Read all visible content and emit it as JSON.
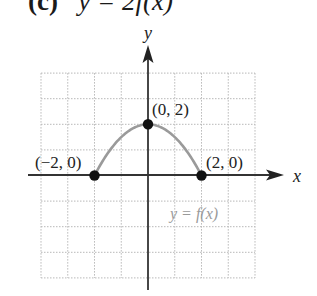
{
  "title": {
    "label": "(c)",
    "equation": "y = 2f(x)"
  },
  "chart_data": {
    "type": "line",
    "title": "(c) y = 2f(x)",
    "xlabel": "x",
    "ylabel": "y",
    "xlim": [
      -4,
      4
    ],
    "ylim": [
      -4,
      4
    ],
    "grid": true,
    "series": [
      {
        "name": "y = f(x)",
        "color": "#9a9a9a",
        "x": [
          -2,
          -1.5,
          -1,
          -0.5,
          0,
          0.5,
          1,
          1.5,
          2
        ],
        "values": [
          0,
          0.875,
          1.5,
          1.875,
          2,
          1.875,
          1.5,
          0.875,
          0
        ]
      }
    ],
    "points": [
      {
        "x": -2,
        "y": 0,
        "label": "(−2, 0)"
      },
      {
        "x": 0,
        "y": 2,
        "label": "(0, 2)"
      },
      {
        "x": 2,
        "y": 0,
        "label": "(2, 0)"
      }
    ],
    "annotations": [
      "y = f(x)"
    ]
  },
  "labels": {
    "x_axis": "x",
    "y_axis": "y",
    "curve": "y = f(x)",
    "p_left": "(−2, 0)",
    "p_top": "(0, 2)",
    "p_right": "(2, 0)"
  }
}
